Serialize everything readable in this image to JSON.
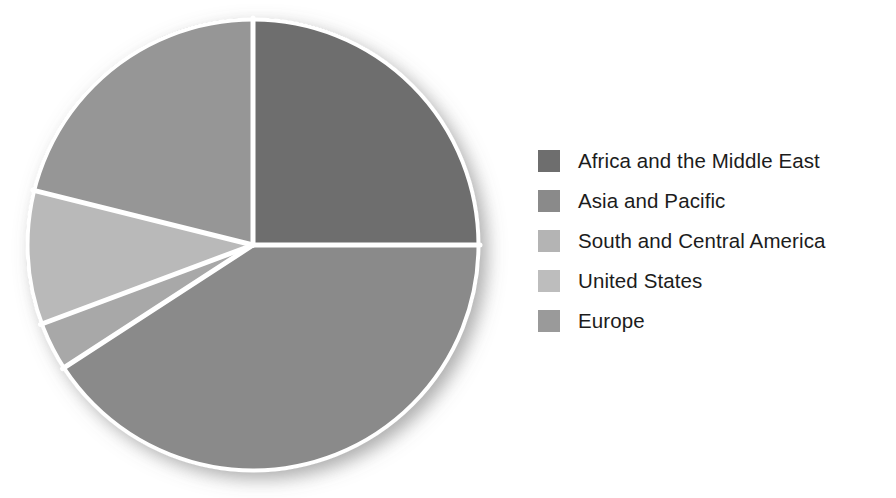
{
  "chart_data": {
    "type": "pie",
    "title": "",
    "subtitle": "",
    "xlabel": "",
    "ylabel": "",
    "grid": false,
    "legend_position": "right",
    "start_angle_deg": 0,
    "direction": "clockwise",
    "separator_color": "#ffffff",
    "background_color": "#ffffff",
    "categories": [
      "Africa and the Middle East",
      "Asia and Pacific",
      "South and Central America",
      "United States",
      "Europe"
    ],
    "values": [
      25.0,
      41.0,
      3.5,
      9.5,
      21.0
    ],
    "units": "percent",
    "slices": [
      {
        "label": "Africa and the Middle East",
        "value": 25.0,
        "color": "#6e6e6e",
        "start_deg": 0,
        "end_deg": 90
      },
      {
        "label": "Asia and Pacific",
        "value": 41.0,
        "color": "#8a8a8a",
        "start_deg": 90,
        "end_deg": 237
      },
      {
        "label": "South and Central America",
        "value": 3.5,
        "color": "#a8a8a8",
        "start_deg": 237,
        "end_deg": 249.5
      },
      {
        "label": "United States",
        "value": 9.5,
        "color": "#b9b9b9",
        "start_deg": 249.5,
        "end_deg": 284
      },
      {
        "label": "Europe",
        "value": 21.0,
        "color": "#969696",
        "start_deg": 284,
        "end_deg": 360
      }
    ],
    "geometry": {
      "center_x": 253,
      "center_y": 245,
      "radius": 227
    }
  },
  "legend": {
    "items": [
      {
        "label": "Africa and the Middle East",
        "swatch_color": "#6e6e6e"
      },
      {
        "label": "Asia and Pacific",
        "swatch_color": "#8a8a8a"
      },
      {
        "label": "South and Central America",
        "swatch_color": "#b4b4b4"
      },
      {
        "label": "United States",
        "swatch_color": "#bdbdbd"
      },
      {
        "label": "Europe",
        "swatch_color": "#9a9a9a"
      }
    ]
  }
}
